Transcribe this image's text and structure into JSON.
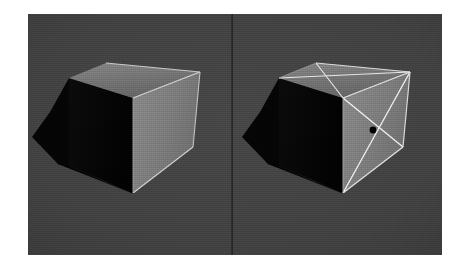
{
  "figure": {
    "background_color": "#ffffff",
    "panel": {
      "x": 28,
      "y": 14,
      "width": 414,
      "height": 241,
      "background_color": "#414141",
      "divider": {
        "x": 204,
        "color": "#232323",
        "width": 1.6
      }
    },
    "panels": [
      {
        "id": "left",
        "name": "shaded-cube-plain",
        "caption": "",
        "origin_x": 0,
        "cube": {
          "top_face_color": "#737373",
          "front_face_color": "#7d7d7d",
          "left_face_color": "#060606",
          "edge_color": "#d8d8d8",
          "shadow_color": "#050505",
          "vertices": {
            "top_back": [
              74,
              49
            ],
            "top_left": [
              39,
              63
            ],
            "top_apex": [
              75,
              49
            ],
            "top_right": [
              170,
              58
            ],
            "front_top": [
              103,
              82
            ],
            "front_right": [
              162,
              131
            ],
            "front_bot": [
              102,
              176
            ],
            "left_bot": [
              38,
              150
            ]
          },
          "shadow_polygon": [
            [
              39,
              63
            ],
            [
              38,
              150
            ],
            [
              102,
              176
            ],
            [
              30,
              145
            ],
            [
              5,
              118
            ],
            [
              22,
              96
            ]
          ]
        }
      },
      {
        "id": "right",
        "name": "shaded-cube-with-diagonals",
        "caption": "",
        "origin_x": 210,
        "cube": {
          "top_face_color": "#737373",
          "front_face_color": "#7d7d7d",
          "left_face_color": "#060606",
          "edge_color": "#e8e8e8",
          "diagonal_color": "#f0f0f0",
          "shadow_color": "#050505",
          "center_dot_color": "#000000",
          "center_dot_radius": 3.2,
          "center_dot": [
            132,
            116
          ],
          "diagonals": [
            {
              "from": "front_top",
              "to": "front_bot_right"
            },
            {
              "from": "front_left",
              "to": "front_top_right"
            },
            {
              "from": "top_left",
              "to": "top_right"
            },
            {
              "from": "top_back",
              "to": "top_front"
            }
          ]
        }
      }
    ]
  }
}
